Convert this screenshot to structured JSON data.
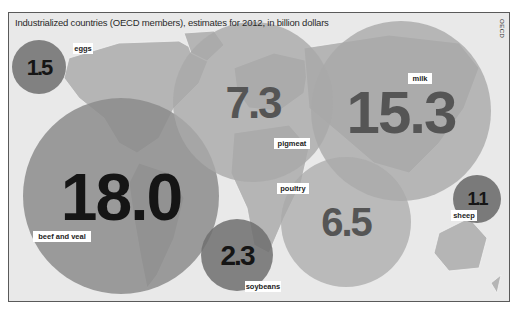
{
  "header": {
    "title": "Industrialized countries (OECD members), estimates for 2012, in billion dollars",
    "source": "OECD"
  },
  "colors": {
    "background": "#e9e9e9",
    "land": "#b5b5b5",
    "bubble_light": "#a9a9a9",
    "bubble_mid": "#8c8c8c",
    "bubble_dark": "#6e6e6e",
    "value_dark": "#151515",
    "value_mid": "#555555",
    "label_bg": "#ffffff"
  },
  "chart_data": {
    "type": "bubble-map",
    "title": "Industrialized countries (OECD members), estimates for 2012, in billion dollars",
    "unit": "billion dollars",
    "source": "OECD",
    "items": [
      {
        "label": "beef and veal",
        "value": 18.0,
        "display": "18.0",
        "region": "Americas"
      },
      {
        "label": "milk",
        "value": 15.3,
        "display": "15.3",
        "region": "Asia"
      },
      {
        "label": "pigmeat",
        "value": 7.3,
        "display": "7.3",
        "region": "Europe"
      },
      {
        "label": "poultry",
        "value": 6.5,
        "display": "6.5",
        "region": "Indian Ocean / Africa"
      },
      {
        "label": "soybeans",
        "value": 2.3,
        "display": "2.3",
        "region": "South Atlantic"
      },
      {
        "label": "eggs",
        "value": 1.5,
        "display": "1.5",
        "region": "North Pacific"
      },
      {
        "label": "sheep",
        "value": 1.1,
        "display": "1.1",
        "region": "Oceania"
      }
    ]
  }
}
